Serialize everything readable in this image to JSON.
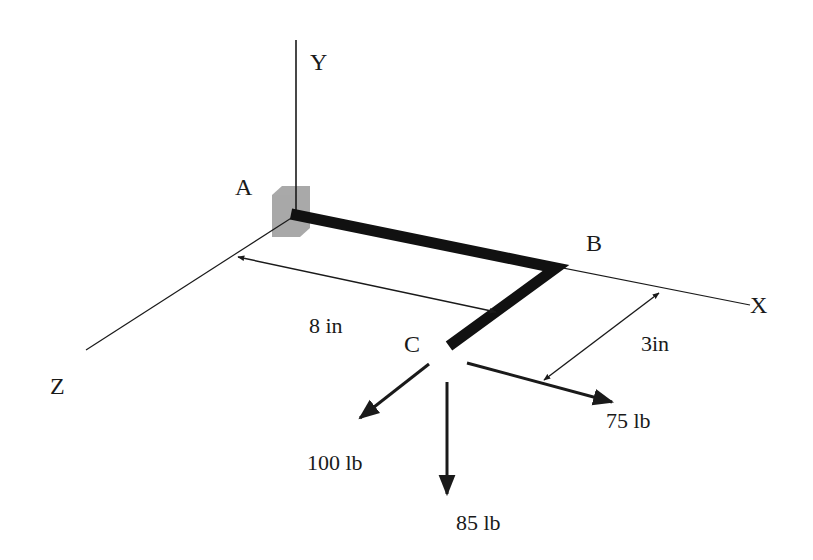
{
  "diagram": {
    "type": "3d-statics-bent-bar",
    "axes": {
      "x": {
        "label": "X"
      },
      "y": {
        "label": "Y"
      },
      "z": {
        "label": "Z"
      }
    },
    "points": {
      "a": {
        "label": "A"
      },
      "b": {
        "label": "B"
      },
      "c": {
        "label": "C"
      }
    },
    "dimensions": {
      "ab_length": "8 in",
      "bc_length": "3in"
    },
    "forces": {
      "f_z": "100 lb",
      "f_y": "85 lb",
      "f_x": "75 lb"
    },
    "colors": {
      "line": "#1a1a1a",
      "bar": "#111111",
      "support": "#9a9a9a"
    }
  }
}
